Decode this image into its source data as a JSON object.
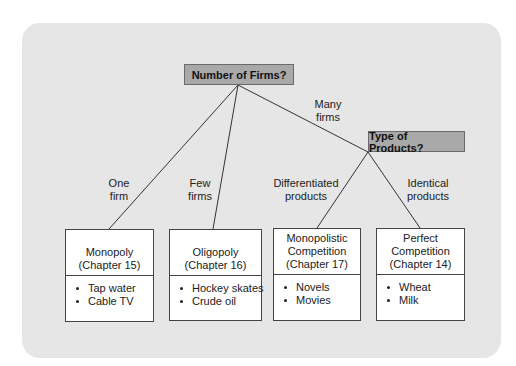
{
  "diagram": {
    "questions": {
      "firms": "Number of Firms?",
      "products": "Type of Products?"
    },
    "edges": {
      "one": [
        "One",
        "firm"
      ],
      "few": [
        "Few",
        "firms"
      ],
      "many": [
        "Many",
        "firms"
      ],
      "differentiated": [
        "Differentiated",
        "products"
      ],
      "identical": [
        "Identical",
        "products"
      ]
    },
    "markets": [
      {
        "title": [
          "",
          "Monopoly",
          "(Chapter 15)"
        ],
        "examples": [
          "Tap water",
          "Cable TV"
        ]
      },
      {
        "title": [
          "",
          "Oligopoly",
          "(Chapter 16)"
        ],
        "examples": [
          "Hockey skates",
          "Crude oil"
        ]
      },
      {
        "title": [
          "Monopolistic",
          "Competition",
          "(Chapter 17)"
        ],
        "examples": [
          "Novels",
          "Movies"
        ]
      },
      {
        "title": [
          "Perfect",
          "Competition",
          "(Chapter 14)"
        ],
        "examples": [
          "Wheat",
          "Milk"
        ]
      }
    ],
    "colors": {
      "panel": "#e6e6e6",
      "question_fill": "#a9a9a9",
      "box_fill": "#ffffff",
      "line": "#333333"
    }
  }
}
